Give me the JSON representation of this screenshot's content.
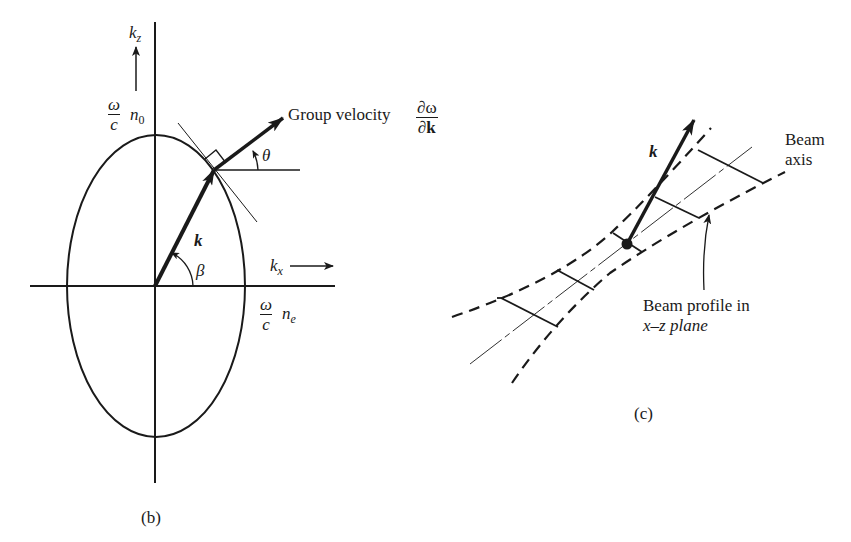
{
  "figure": {
    "panel_b": {
      "caption": "(b)",
      "axis_z_label": "k",
      "axis_z_sub": "z",
      "axis_x_label": "k",
      "axis_x_sub": "x",
      "n0_frac_num": "ω",
      "n0_frac_den": "c",
      "n0_label": "n",
      "n0_sub": "0",
      "ne_frac_num": "ω",
      "ne_frac_den": "c",
      "ne_label": "n",
      "ne_sub": "e",
      "k_vector_label": "k",
      "beta_label": "β",
      "theta_label": "θ",
      "group_velocity_text": "Group velocity",
      "group_velocity_num": "∂ω",
      "group_velocity_den": "∂k"
    },
    "panel_c": {
      "caption": "(c)",
      "k_vector_label": "k",
      "beam_axis_line1": "Beam",
      "beam_axis_line2": "axis",
      "beam_profile_line1": "Beam profile in",
      "beam_profile_line2": "x–z plane"
    }
  },
  "colors": {
    "ink": "#1a1a1a",
    "background": "#ffffff"
  }
}
